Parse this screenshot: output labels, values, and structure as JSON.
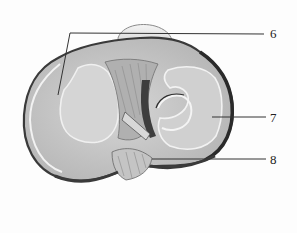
{
  "figure": {
    "labels": [
      {
        "id": "6",
        "text": "6",
        "x": 272,
        "y": 27
      },
      {
        "id": "7",
        "text": "7",
        "x": 272,
        "y": 111
      },
      {
        "id": "8",
        "text": "8",
        "x": 272,
        "y": 153
      }
    ],
    "colors": {
      "background": "#fdfdfd",
      "outline": "#3a3a3a",
      "plateau_fill": "#c9c9c9",
      "cartilage_fill": "#d9d9d9",
      "highlight": "#f2f2f2",
      "leader_line": "#333333"
    }
  }
}
